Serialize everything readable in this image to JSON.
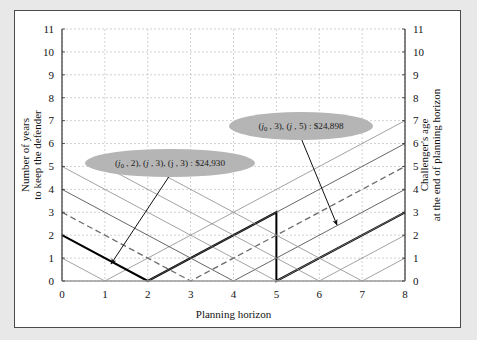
{
  "figure": {
    "background": "#ffffff",
    "outer_background": "#e8e8e8",
    "border_color": "#4a4a4a"
  },
  "axes": {
    "x_title": "Planning horizon",
    "y_left_title_line1": "Number of years",
    "y_left_title_line2": "to keep the defender",
    "y_right_title_line1": "Challenger's age",
    "y_right_title_line2": "at the end of planning horizon",
    "x_ticks": [
      "0",
      "1",
      "2",
      "3",
      "4",
      "5",
      "6",
      "7",
      "8"
    ],
    "y_left_ticks": [
      "0",
      "1",
      "2",
      "3",
      "4",
      "5",
      "6",
      "7",
      "8",
      "9",
      "10",
      "11"
    ],
    "y_right_ticks": [
      "0",
      "1",
      "2",
      "3",
      "4",
      "5",
      "6",
      "7",
      "8",
      "9",
      "10",
      "11"
    ]
  },
  "callouts": [
    {
      "id": "callout-upper",
      "text_main_a": "(",
      "label_j0": "j",
      "sub_0": "0",
      "text_mid": " , 3), (",
      "label_j": "j",
      "text_end": " , 5) : $24,898",
      "full_text": "(j0 , 3), (j , 5) : $24,898",
      "fill": "#b5b5b5",
      "cx": 286,
      "cy": 115,
      "rx": 72,
      "ry": 14,
      "arrow_to_x": 322,
      "arrow_to_y": 214
    },
    {
      "id": "callout-lower",
      "label_j0": "j",
      "sub_0": "0",
      "text_mid": " , 2), (",
      "label_j": "j",
      "text_end": " , 3), (j , 3) : $24,930",
      "full_text": "(j0 , 2), (j , 3), (j , 3) : $24,930",
      "fill": "#b5b5b5",
      "cx": 155,
      "cy": 152,
      "rx": 85,
      "ry": 14,
      "arrow_to_x": 96,
      "arrow_to_y": 253
    }
  ],
  "chart_data": {
    "type": "line",
    "title": "",
    "xlabel": "Planning horizon",
    "ylabel": "Number of years to keep the defender",
    "ylabel_right": "Challenger's age at the end of planning horizon",
    "xlim": [
      0,
      8
    ],
    "ylim": [
      0,
      11
    ],
    "grid": true,
    "legend": "none",
    "series": [
      {
        "name": "v-path-start-1",
        "style": "thin",
        "color": "#8a8a8a",
        "width": 0.8,
        "points": [
          [
            0,
            1
          ],
          [
            1,
            0
          ],
          [
            8,
            7
          ]
        ]
      },
      {
        "name": "v-path-start-2-optimal",
        "style": "bold",
        "color": "#000000",
        "width": 2.0,
        "points": [
          [
            0,
            2
          ],
          [
            2,
            0
          ],
          [
            5,
            3
          ],
          [
            5,
            0
          ],
          [
            8,
            3
          ]
        ]
      },
      {
        "name": "v-path-start-3-dashed",
        "style": "dashed",
        "color": "#6a6a6a",
        "width": 1.3,
        "points": [
          [
            0,
            3
          ],
          [
            3,
            0
          ],
          [
            8,
            5
          ]
        ]
      },
      {
        "name": "v-path-start-4",
        "style": "thin",
        "color": "#555555",
        "width": 0.9,
        "points": [
          [
            0,
            4
          ],
          [
            4,
            0
          ],
          [
            8,
            4
          ]
        ]
      },
      {
        "name": "v-path-start-5",
        "style": "thin",
        "color": "#8a8a8a",
        "width": 0.8,
        "points": [
          [
            0,
            5
          ],
          [
            5,
            0
          ],
          [
            8,
            3
          ]
        ]
      },
      {
        "name": "v-path-start-6",
        "style": "thin",
        "color": "#8a8a8a",
        "width": 0.8,
        "points": [
          [
            1,
            5
          ],
          [
            6,
            0
          ],
          [
            8,
            2
          ]
        ]
      },
      {
        "name": "v-path-start-7",
        "style": "thin",
        "color": "#8a8a8a",
        "width": 0.8,
        "points": [
          [
            2,
            5
          ],
          [
            7,
            0
          ],
          [
            8,
            1
          ]
        ]
      },
      {
        "name": "ascending-6",
        "style": "thin",
        "color": "#555555",
        "width": 0.9,
        "points": [
          [
            2,
            0
          ],
          [
            8,
            6
          ]
        ]
      }
    ]
  }
}
